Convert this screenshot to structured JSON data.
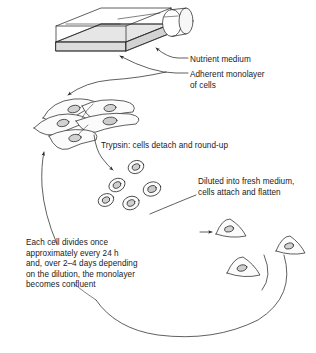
{
  "figure": {
    "type": "line-art-biology-diagram",
    "width": 316,
    "height": 353,
    "background_color": "#ffffff",
    "stroke_color": "#2b2b2b",
    "fill_light": "#efefef",
    "fill_nucleus": "#d2d2d2",
    "fill_medium": "#e3e3e3"
  },
  "labels": {
    "nutrient_medium": "Nutrient medium",
    "adherent_monolayer_line1": "Adherent monolayer",
    "adherent_monolayer_line2": "of cells",
    "trypsin": "Trypsin: cells detach and round-up",
    "diluted_line1": "Diluted into fresh medium,",
    "diluted_line2": "cells attach and flatten",
    "growth_line1": "Each cell divides once",
    "growth_line2": "approximately every 24 h",
    "growth_line3": "and, over 2–4 days depending",
    "growth_line4": "on the dilution, the monolayer",
    "growth_line5": "becomes confluent"
  },
  "elements": {
    "culture_flask": "culture-flask",
    "flask_neck": "flask-neck",
    "medium_layer": "nutrient-medium-layer",
    "adherent_cells_count": 5,
    "rounded_cells_count": 5,
    "flattened_cells_count": 3
  }
}
